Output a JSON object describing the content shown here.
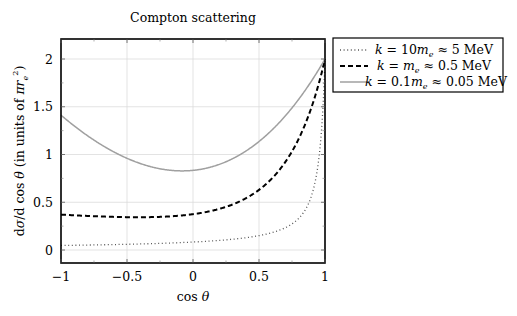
{
  "chart_data": {
    "type": "line",
    "title": "Compton scattering",
    "xlabel": "cos θ",
    "ylabel": "dσ/d cos θ (in units of πr_e²)",
    "xlim": [
      -1,
      1
    ],
    "ylim": [
      -0.15,
      2.2
    ],
    "xticks": [
      -1,
      -0.5,
      0,
      0.5,
      1
    ],
    "xtick_labels": [
      "−1",
      "−0.5",
      "0",
      "0.5",
      "1"
    ],
    "yticks": [
      0,
      0.5,
      1,
      1.5,
      2
    ],
    "ytick_labels": [
      "0",
      "0.5",
      "1",
      "1.5",
      "2"
    ],
    "grid": true,
    "legend_position": "outside right, top",
    "formula": "Klein–Nishina: P=1/(1+ε(1−x)), y=P²(P+1/P−(1−x²))",
    "series": [
      {
        "name": "k = 10mₑ ≈ 5 MeV",
        "epsilon": 10,
        "style": "dotted",
        "color": "#555555",
        "x": [
          -1,
          -0.75,
          -0.5,
          -0.25,
          0,
          0.25,
          0.5,
          0.75,
          0.9,
          0.95,
          1
        ],
        "values": [
          0.05,
          0.06,
          0.07,
          0.08,
          0.09,
          0.11,
          0.17,
          0.33,
          0.84,
          1.35,
          2.0
        ]
      },
      {
        "name": "k = mₑ ≈ 0.5 MeV",
        "epsilon": 1,
        "style": "dashed",
        "color": "#000000",
        "x": [
          -1,
          -0.75,
          -0.5,
          -0.25,
          0,
          0.25,
          0.5,
          0.75,
          1
        ],
        "values": [
          0.37,
          0.36,
          0.35,
          0.36,
          0.38,
          0.45,
          0.59,
          0.98,
          2.0
        ]
      },
      {
        "name": "k = 0.1mₑ ≈ 0.05 MeV",
        "epsilon": 0.1,
        "style": "solid",
        "color": "#a0a0a0",
        "x": [
          -1,
          -0.75,
          -0.5,
          -0.25,
          0,
          0.25,
          0.5,
          0.75,
          1
        ],
        "values": [
          1.41,
          1.16,
          0.98,
          0.87,
          0.84,
          0.93,
          1.13,
          1.48,
          2.0
        ]
      }
    ]
  },
  "legend": {
    "items": [
      {
        "pre": "k",
        "mid": " = 10",
        "sym": "m",
        "sub": "e",
        "post": " ≈ 5 MeV"
      },
      {
        "pre": "k",
        "mid": " = ",
        "sym": "m",
        "sub": "e",
        "post": " ≈ 0.5 MeV"
      },
      {
        "pre": "k",
        "mid": " = 0.1",
        "sym": "m",
        "sub": "e",
        "post": " ≈ 0.05 MeV"
      }
    ]
  }
}
